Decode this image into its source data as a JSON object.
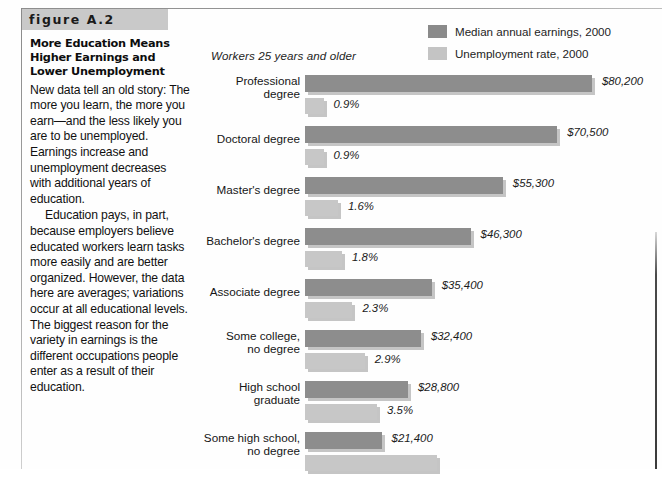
{
  "figure": {
    "banner_label": "figure A.2",
    "title": "More Education Means Higher Earnings and Lower Unemployment",
    "paragraphs": [
      "New data tell an old story: The more you learn, the more you earn—and the less likely you are to be unemployed. Earnings increase and unemployment decreases with additional years of education.",
      "Education pays, in part, because employers believe educated workers learn tasks more easily and are better organized. However, the data here are averages; variations occur at all educational levels. The biggest reason for the variety in earnings is the different occupations people enter as a result of their education."
    ]
  },
  "chart_data": {
    "type": "bar",
    "orientation": "horizontal",
    "title": "More Education Means Higher Earnings and Lower Unemployment",
    "subtitle": "Workers 25 years and older",
    "xlabel": "",
    "ylabel": "",
    "grid": false,
    "legend_position": "top-right",
    "colors": {
      "earnings": "#8d8d8d",
      "unemployment": "#c7c7c7"
    },
    "legend": [
      {
        "label": "Median annual earnings, 2000",
        "swatch": "dark"
      },
      {
        "label": "Unemployment rate, 2000",
        "swatch": "light"
      }
    ],
    "categories": [
      "Professional\ndegree",
      "Doctoral degree",
      "Master's degree",
      "Bachelor's degree",
      "Associate degree",
      "Some college,\nno degree",
      "High school\ngraduate",
      "Some high school,\nno degree"
    ],
    "series": [
      {
        "name": "Median annual earnings, 2000",
        "unit": "USD",
        "values": [
          80200,
          70500,
          55300,
          46300,
          35400,
          32400,
          28800,
          21400
        ],
        "labels": [
          "$80,200",
          "$70,500",
          "$55,300",
          "$46,300",
          "$35,400",
          "$32,400",
          "$28,800",
          "$21,400"
        ]
      },
      {
        "name": "Unemployment rate, 2000",
        "unit": "percent",
        "values": [
          0.9,
          0.9,
          1.6,
          1.8,
          2.3,
          2.9,
          3.5,
          6.4
        ],
        "labels": [
          "0.9%",
          "0.9%",
          "1.6%",
          "1.8%",
          "2.3%",
          "2.9%",
          "3.5%",
          ""
        ]
      }
    ],
    "earnings_px_per_dollar": 0.003577,
    "unemployment_px_per_percent": 20.6,
    "note": "last category's unemployment bar and value label are clipped by the bottom edge of the screenshot"
  }
}
